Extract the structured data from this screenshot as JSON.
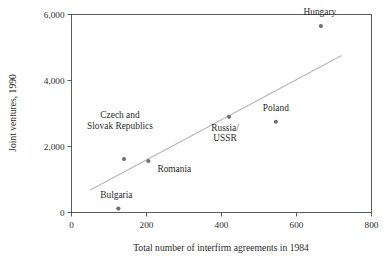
{
  "chart_data": {
    "type": "scatter",
    "title": "",
    "xlabel": "Total number of interfirm agreements in 1984",
    "ylabel": "Joint ventures, 1990",
    "xlim": [
      0,
      800
    ],
    "ylim": [
      0,
      6000
    ],
    "xticks": [
      "0",
      "200",
      "400",
      "600",
      "800"
    ],
    "xtick_values": [
      0,
      200,
      400,
      600,
      800
    ],
    "yticks": [
      "0",
      "2,000",
      "4,000",
      "6,000"
    ],
    "ytick_values": [
      0,
      2000,
      4000,
      6000
    ],
    "grid": false,
    "legend": "none",
    "frame": "box",
    "marker_color": "#6f6f74",
    "trendline_color": "#b6b6b6",
    "axis_color": "#4a4a4a",
    "points": [
      {
        "label": "Bulgaria",
        "x": 125,
        "y": 120,
        "label_dx": -2,
        "label_dy": -11,
        "label_anchor": "middle",
        "label_lines": [
          "Bulgaria"
        ]
      },
      {
        "label": "Czech and Slovak Republics",
        "x": 140,
        "y": 1620,
        "label_dx": -4,
        "label_dy": -30,
        "label_anchor": "middle",
        "label_lines": [
          "Czech and",
          "Slovak Republics"
        ]
      },
      {
        "label": "Romania",
        "x": 205,
        "y": 1560,
        "label_dx": 9,
        "label_dy": 11,
        "label_anchor": "start",
        "label_lines": [
          "Romania"
        ]
      },
      {
        "label": "Russia/USSR",
        "x": 420,
        "y": 2900,
        "label_dx": -4,
        "label_dy": 14,
        "label_anchor": "middle",
        "label_lines": [
          "Russia/",
          "USSR"
        ]
      },
      {
        "label": "Poland",
        "x": 545,
        "y": 2750,
        "label_dx": 0,
        "label_dy": -11,
        "label_anchor": "middle",
        "label_lines": [
          "Poland"
        ]
      },
      {
        "label": "Hungary",
        "x": 665,
        "y": 5650,
        "label_dx": -1,
        "label_dy": -11,
        "label_anchor": "middle",
        "label_lines": [
          "Hungary"
        ]
      }
    ],
    "trendline": {
      "x_start": 50,
      "y_start": 680,
      "x_end": 720,
      "y_end": 4760
    }
  }
}
